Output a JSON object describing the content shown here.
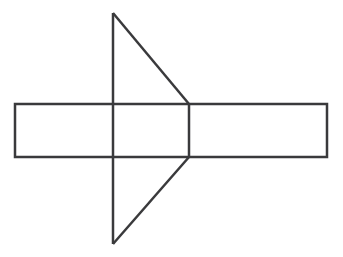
{
  "canvas": {
    "width": 343,
    "height": 257,
    "background_color": "#ffffff"
  },
  "style": {
    "stroke_color": "#3a3a3c",
    "stroke_width": 2.5,
    "fill": "none"
  },
  "figure": {
    "shapes": [
      {
        "name": "horizontal-rectangle",
        "type": "rect",
        "x": 15,
        "y": 104,
        "width": 312,
        "height": 53,
        "points": "15,104 327,104 327,157 15,157"
      },
      {
        "name": "left-pointing-triangle-upper",
        "type": "polyline",
        "points": "113,13 113,244"
      },
      {
        "name": "triangle-upper-slant",
        "type": "polyline",
        "points": "113,13 189,104"
      },
      {
        "name": "triangle-lower-slant",
        "type": "polyline",
        "points": "113,244 189,157"
      },
      {
        "name": "triangle-right-vertical",
        "type": "polyline",
        "points": "189,104 189,157"
      }
    ],
    "vertices": [
      {
        "name": "triangle-apex-top",
        "x": 113,
        "y": 13
      },
      {
        "name": "triangle-apex-bottom",
        "x": 113,
        "y": 244
      },
      {
        "name": "triangle-right-top",
        "x": 189,
        "y": 104
      },
      {
        "name": "triangle-right-bottom",
        "x": 189,
        "y": 157
      },
      {
        "name": "rect-top-left",
        "x": 15,
        "y": 104
      },
      {
        "name": "rect-top-right",
        "x": 327,
        "y": 104
      },
      {
        "name": "rect-bottom-right",
        "x": 327,
        "y": 157
      },
      {
        "name": "rect-bottom-left",
        "x": 15,
        "y": 157
      }
    ]
  },
  "labels": []
}
